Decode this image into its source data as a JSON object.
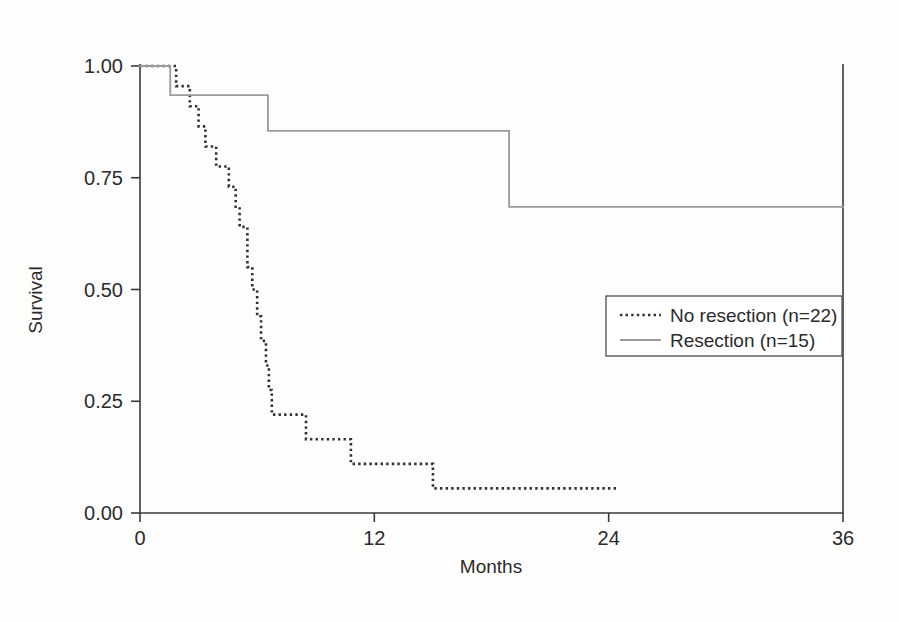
{
  "chart_data": {
    "type": "line",
    "subtype": "kaplan-meier-step",
    "title": "",
    "xlabel": "Months",
    "ylabel": "Survival",
    "xlim": [
      0,
      36
    ],
    "ylim": [
      0.0,
      1.0
    ],
    "xticks": [
      0,
      12,
      24,
      36
    ],
    "xtick_labels": [
      "0",
      "12",
      "24",
      "36"
    ],
    "yticks": [
      0.0,
      0.25,
      0.5,
      0.75,
      1.0
    ],
    "ytick_labels": [
      "0.00",
      "0.25",
      "0.50",
      "0.75",
      "1.00"
    ],
    "grid": false,
    "legend_position": "center-right",
    "series": [
      {
        "name": "No resection (n=22)",
        "label": "No resection (n=22)",
        "n": 22,
        "style": "dotted",
        "color": "#33302e",
        "points": [
          [
            0.0,
            1.0
          ],
          [
            1.85,
            1.0
          ],
          [
            1.85,
            0.955
          ],
          [
            2.55,
            0.955
          ],
          [
            2.55,
            0.91
          ],
          [
            3.0,
            0.91
          ],
          [
            3.0,
            0.865
          ],
          [
            3.35,
            0.865
          ],
          [
            3.35,
            0.82
          ],
          [
            3.9,
            0.82
          ],
          [
            3.9,
            0.775
          ],
          [
            4.55,
            0.775
          ],
          [
            4.55,
            0.73
          ],
          [
            4.9,
            0.73
          ],
          [
            4.9,
            0.685
          ],
          [
            5.1,
            0.685
          ],
          [
            5.1,
            0.64
          ],
          [
            5.5,
            0.64
          ],
          [
            5.5,
            0.55
          ],
          [
            5.75,
            0.55
          ],
          [
            5.75,
            0.5
          ],
          [
            6.0,
            0.5
          ],
          [
            6.0,
            0.44
          ],
          [
            6.2,
            0.44
          ],
          [
            6.2,
            0.385
          ],
          [
            6.45,
            0.385
          ],
          [
            6.45,
            0.33
          ],
          [
            6.6,
            0.33
          ],
          [
            6.6,
            0.275
          ],
          [
            6.75,
            0.275
          ],
          [
            6.75,
            0.22
          ],
          [
            8.5,
            0.22
          ],
          [
            8.5,
            0.165
          ],
          [
            10.8,
            0.165
          ],
          [
            10.8,
            0.11
          ],
          [
            15.0,
            0.11
          ],
          [
            15.0,
            0.055
          ],
          [
            24.4,
            0.055
          ]
        ]
      },
      {
        "name": "Resection (n=15)",
        "label": "Resection (n=15)",
        "n": 15,
        "style": "solid",
        "color": "#9a9a9a",
        "points": [
          [
            0.0,
            1.0
          ],
          [
            1.55,
            1.0
          ],
          [
            1.55,
            0.935
          ],
          [
            6.55,
            0.935
          ],
          [
            6.55,
            0.855
          ],
          [
            18.9,
            0.855
          ],
          [
            18.9,
            0.685
          ],
          [
            36.0,
            0.685
          ]
        ]
      }
    ]
  },
  "axes": {
    "x_title": "Months",
    "y_title": "Survival",
    "x_tick_labels": [
      "0",
      "12",
      "24",
      "36"
    ],
    "y_tick_labels": [
      "0.00",
      "0.25",
      "0.50",
      "0.75",
      "1.00"
    ]
  },
  "legend": {
    "entries": [
      {
        "label": "No resection (n=22)",
        "style": "dotted",
        "color": "#33302e"
      },
      {
        "label": "Resection (n=15)",
        "style": "solid",
        "color": "#9a9a9a"
      }
    ]
  },
  "colors": {
    "background": "#fdfdfc",
    "axis": "#3a3a3a",
    "no_resection": "#33302e",
    "resection": "#9a9a9a",
    "legend_border": "#5a5a5a",
    "text": "#2b2b2b"
  }
}
